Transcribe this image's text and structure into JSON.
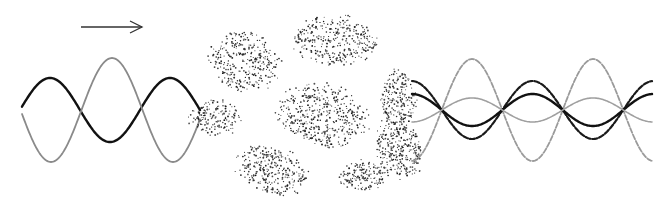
{
  "figure": {
    "arrow": {
      "x1": 81,
      "y1": 27,
      "x2": 142,
      "y2": 27,
      "direction": "right",
      "color": "#333333"
    },
    "incident_waves": {
      "x_start": 22,
      "x_end": 200,
      "center_y": 110,
      "series": [
        {
          "name": "black-wave",
          "color": "#111111",
          "width": 2.4,
          "amplitude": 32,
          "period": 120,
          "phase_x": 50,
          "style": "solid"
        },
        {
          "name": "gray-wave",
          "color": "#8a8a8a",
          "width": 1.8,
          "amplitude": 52,
          "period": 122,
          "phase_x": 112,
          "style": "solid"
        }
      ]
    },
    "scatter_blobs": [
      {
        "cx": 245,
        "cy": 62,
        "rx": 34,
        "ry": 28,
        "rot": 20,
        "n": 320
      },
      {
        "cx": 335,
        "cy": 40,
        "rx": 40,
        "ry": 24,
        "rot": 5,
        "n": 330
      },
      {
        "cx": 215,
        "cy": 118,
        "rx": 24,
        "ry": 18,
        "rot": 0,
        "n": 160
      },
      {
        "cx": 322,
        "cy": 115,
        "rx": 44,
        "ry": 30,
        "rot": 15,
        "n": 460
      },
      {
        "cx": 272,
        "cy": 170,
        "rx": 36,
        "ry": 22,
        "rot": 15,
        "n": 300
      },
      {
        "cx": 398,
        "cy": 100,
        "rx": 18,
        "ry": 30,
        "rot": 0,
        "n": 220
      },
      {
        "cx": 400,
        "cy": 150,
        "rx": 22,
        "ry": 28,
        "rot": -30,
        "n": 280
      },
      {
        "cx": 365,
        "cy": 175,
        "rx": 26,
        "ry": 14,
        "rot": -10,
        "n": 160
      }
    ],
    "outgoing_waves": {
      "x_start": 412,
      "x_end": 652,
      "center_y": 110,
      "series": [
        {
          "name": "gray-dashed-wave",
          "color": "#9a9a9a",
          "width": 1.8,
          "amplitude": 51,
          "period": 121,
          "phase_x": 472,
          "style": "dashed"
        },
        {
          "name": "black-dashed-wave",
          "color": "#1a1a1a",
          "width": 2.2,
          "amplitude": -29,
          "period": 121,
          "phase_x": 472,
          "style": "dashed"
        },
        {
          "name": "black-solid-wave",
          "color": "#111111",
          "width": 2.4,
          "amplitude": -16,
          "period": 121,
          "phase_x": 472,
          "style": "solid"
        },
        {
          "name": "light-gray-solid-wave",
          "color": "#a0a0a0",
          "width": 1.6,
          "amplitude": 12,
          "period": 121,
          "phase_x": 472,
          "style": "solid"
        }
      ]
    }
  }
}
